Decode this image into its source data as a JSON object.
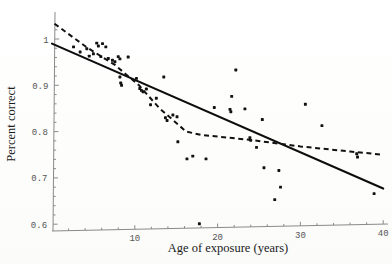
{
  "figure": {
    "name": "age-of-exposure-scatter",
    "background_color": "#fefefe",
    "point_color": "#111111",
    "axis_color": "#8a8a8a",
    "line_color": "#0d0d0d"
  },
  "chart_data": {
    "type": "scatter",
    "title": "",
    "subtitle": "",
    "xlabel": "Age of exposure (years)",
    "ylabel": "Percent correct",
    "xlim": [
      0,
      41
    ],
    "ylim": [
      0.58,
      1.04
    ],
    "xticks": [
      10,
      20,
      30,
      40
    ],
    "xtick_labels": [
      "10",
      "20",
      "30",
      "40"
    ],
    "yticks": [
      0.6,
      0.7,
      0.8,
      0.9,
      1.0
    ],
    "ytick_labels": [
      "0.6",
      "0.7",
      "0.8",
      "0.9",
      "1"
    ],
    "grid": false,
    "legend": "none",
    "points": [
      {
        "x": 2.6,
        "y": 0.983
      },
      {
        "x": 3.4,
        "y": 0.972
      },
      {
        "x": 4.2,
        "y": 0.979
      },
      {
        "x": 4.5,
        "y": 0.963
      },
      {
        "x": 5.0,
        "y": 0.968
      },
      {
        "x": 5.4,
        "y": 0.991
      },
      {
        "x": 5.6,
        "y": 0.985
      },
      {
        "x": 5.9,
        "y": 0.962
      },
      {
        "x": 6.1,
        "y": 0.99
      },
      {
        "x": 6.5,
        "y": 0.983
      },
      {
        "x": 6.8,
        "y": 0.958
      },
      {
        "x": 7.3,
        "y": 0.954
      },
      {
        "x": 7.6,
        "y": 0.951
      },
      {
        "x": 8.0,
        "y": 0.962
      },
      {
        "x": 8.2,
        "y": 0.957
      },
      {
        "x": 8.2,
        "y": 0.918
      },
      {
        "x": 8.3,
        "y": 0.905
      },
      {
        "x": 8.4,
        "y": 0.9
      },
      {
        "x": 9.2,
        "y": 0.961
      },
      {
        "x": 10.2,
        "y": 0.915
      },
      {
        "x": 10.6,
        "y": 0.893
      },
      {
        "x": 10.8,
        "y": 0.889
      },
      {
        "x": 11.0,
        "y": 0.886
      },
      {
        "x": 11.4,
        "y": 0.892
      },
      {
        "x": 11.9,
        "y": 0.858
      },
      {
        "x": 12.6,
        "y": 0.872
      },
      {
        "x": 13.5,
        "y": 0.918
      },
      {
        "x": 13.7,
        "y": 0.83
      },
      {
        "x": 13.9,
        "y": 0.824
      },
      {
        "x": 14.6,
        "y": 0.836
      },
      {
        "x": 15.1,
        "y": 0.832
      },
      {
        "x": 15.2,
        "y": 0.778
      },
      {
        "x": 16.3,
        "y": 0.741
      },
      {
        "x": 17.0,
        "y": 0.747
      },
      {
        "x": 17.8,
        "y": 0.601
      },
      {
        "x": 18.6,
        "y": 0.741
      },
      {
        "x": 19.6,
        "y": 0.852
      },
      {
        "x": 21.5,
        "y": 0.848
      },
      {
        "x": 21.6,
        "y": 0.843
      },
      {
        "x": 21.7,
        "y": 0.876
      },
      {
        "x": 22.2,
        "y": 0.933
      },
      {
        "x": 23.3,
        "y": 0.849
      },
      {
        "x": 23.9,
        "y": 0.787
      },
      {
        "x": 24.0,
        "y": 0.781
      },
      {
        "x": 24.7,
        "y": 0.766
      },
      {
        "x": 25.4,
        "y": 0.826
      },
      {
        "x": 25.6,
        "y": 0.722
      },
      {
        "x": 26.9,
        "y": 0.653
      },
      {
        "x": 27.4,
        "y": 0.716
      },
      {
        "x": 27.6,
        "y": 0.68
      },
      {
        "x": 30.6,
        "y": 0.859
      },
      {
        "x": 32.6,
        "y": 0.813
      },
      {
        "x": 36.8,
        "y": 0.752
      },
      {
        "x": 36.9,
        "y": 0.745
      },
      {
        "x": 38.9,
        "y": 0.666
      }
    ],
    "series": [
      {
        "name": "linear-regression-solid",
        "style": "solid",
        "points": [
          {
            "x": 0.0,
            "y": 0.99
          },
          {
            "x": 40.0,
            "y": 0.677
          }
        ]
      },
      {
        "name": "piecewise-fit-dashed",
        "style": "dashed",
        "points": [
          {
            "x": 0.3,
            "y": 1.033
          },
          {
            "x": 4.2,
            "y": 0.982
          },
          {
            "x": 7.6,
            "y": 0.944
          },
          {
            "x": 10.5,
            "y": 0.9
          },
          {
            "x": 13.0,
            "y": 0.85
          },
          {
            "x": 14.8,
            "y": 0.822
          },
          {
            "x": 16.2,
            "y": 0.8
          },
          {
            "x": 18.0,
            "y": 0.793
          },
          {
            "x": 24.0,
            "y": 0.782
          },
          {
            "x": 30.0,
            "y": 0.768
          },
          {
            "x": 36.0,
            "y": 0.757
          },
          {
            "x": 40.0,
            "y": 0.75
          }
        ]
      }
    ]
  }
}
